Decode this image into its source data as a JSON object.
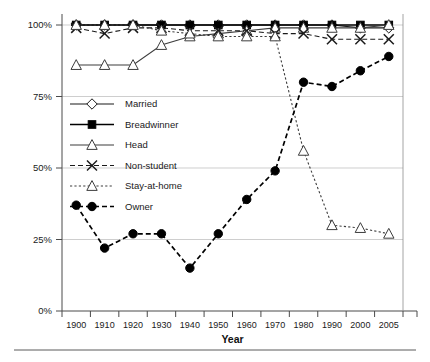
{
  "chart_data": {
    "type": "line",
    "title": "",
    "xlabel": "Year",
    "ylabel": "",
    "x": [
      1900,
      1910,
      1920,
      1930,
      1940,
      1950,
      1960,
      1970,
      1980,
      1990,
      2000,
      2005
    ],
    "categories": [
      "1900",
      "1910",
      "1920",
      "1930",
      "1940",
      "1950",
      "1960",
      "1970",
      "1980",
      "1990",
      "2000",
      "2005"
    ],
    "ylim": [
      0,
      100
    ],
    "ytick_values": [
      0,
      25,
      50,
      75,
      100
    ],
    "ytick_labels": [
      "0%",
      "25%",
      "50%",
      "75%",
      "100%"
    ],
    "grid": "horizontal",
    "legend_position": "inside-left-middle",
    "series": [
      {
        "name": "Married",
        "marker": "diamond-open",
        "line": "solid",
        "color": "#1a1a1a",
        "values": [
          100,
          100,
          100,
          100,
          100,
          100,
          100,
          100,
          100,
          100,
          99,
          99
        ]
      },
      {
        "name": "Breadwinner",
        "marker": "square-filled",
        "line": "solid",
        "color": "#000000",
        "values": [
          100,
          100,
          100,
          100,
          100,
          100,
          100,
          100,
          100,
          100,
          100,
          100
        ]
      },
      {
        "name": "Head",
        "marker": "triangle-open",
        "line": "solid",
        "color": "#3d3d3d",
        "values": [
          86,
          86,
          86,
          93,
          96,
          97,
          98,
          99,
          99,
          99,
          99,
          100
        ]
      },
      {
        "name": "Non-student",
        "marker": "x-cross",
        "line": "dashed",
        "color": "#1a1a1a",
        "values": [
          99,
          97,
          99,
          99,
          98,
          98,
          98,
          97,
          97,
          95,
          95,
          95
        ]
      },
      {
        "name": "Stay-at-home",
        "marker": "triangle-open",
        "line": "dotted",
        "color": "#3d3d3d",
        "values": [
          100,
          100,
          100,
          98,
          97,
          96,
          96,
          96,
          56,
          30,
          29,
          27
        ]
      },
      {
        "name": "Owner",
        "marker": "circle-filled",
        "line": "dashed",
        "color": "#000000",
        "values": [
          37,
          22,
          27,
          27,
          15,
          27,
          39,
          49,
          80,
          78.5,
          84,
          89
        ]
      }
    ]
  }
}
